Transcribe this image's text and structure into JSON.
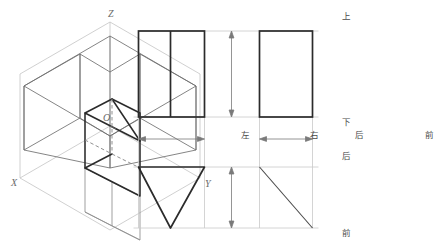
{
  "figure": {
    "colors": {
      "solid_line": "#2b2b2b",
      "construction_line": "#b8b8b8",
      "projection_plane": "#bdbdbd",
      "hidden_line": "#8a8a8a",
      "label_text": "#5a5a5a",
      "background": "#ffffff"
    }
  },
  "iso_view": {
    "name": "axonometric-projection-view",
    "axis_labels": [
      {
        "id": "z-axis-label",
        "text": "Z",
        "x": 108,
        "y": 9
      },
      {
        "id": "x-axis-label",
        "text": "X",
        "x": 11,
        "y": 178
      },
      {
        "id": "y-axis-label",
        "text": "Y",
        "x": 205,
        "y": 179
      },
      {
        "id": "origin-label",
        "text": "O",
        "x": 103,
        "y": 113
      }
    ]
  },
  "ortho_view": {
    "name": "orthographic-projection-layout",
    "dimension_labels": [
      {
        "id": "dim-label-up",
        "text": "上",
        "x": 342,
        "y": 16
      },
      {
        "id": "dim-label-down",
        "text": "下",
        "x": 342,
        "y": 119
      },
      {
        "id": "dim-label-left",
        "text": "左",
        "x": 243,
        "y": 131
      },
      {
        "id": "dim-label-right",
        "text": "右",
        "x": 310,
        "y": 131
      },
      {
        "id": "dim-label-back-h",
        "text": "后",
        "x": 355,
        "y": 131
      },
      {
        "id": "dim-label-front-h",
        "text": "前",
        "x": 425,
        "y": 131
      },
      {
        "id": "dim-label-back-v",
        "text": "后",
        "x": 342,
        "y": 155
      },
      {
        "id": "dim-label-front-v",
        "text": "前",
        "x": 342,
        "y": 231
      }
    ],
    "views": [
      {
        "id": "front-view",
        "shape": "divided-rectangle",
        "x": 250,
        "y": 31,
        "width": 66,
        "height": 86,
        "divider_x": 282
      },
      {
        "id": "side-view",
        "shape": "rectangle",
        "x": 371,
        "y": 31,
        "width": 53,
        "height": 86
      },
      {
        "id": "top-view",
        "shape": "inverted-triangle",
        "x": 250,
        "y": 167,
        "width": 66,
        "height": 61
      },
      {
        "id": "aux-view",
        "shape": "diagonal-line",
        "x1": 371,
        "y1": 167,
        "x2": 424,
        "y2": 228
      }
    ]
  }
}
